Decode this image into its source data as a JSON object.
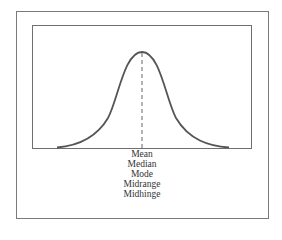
{
  "figure": {
    "type": "symmetric bell-shaped distribution",
    "curve_color": "#555555",
    "frame_color": "#7a7a7a",
    "center_line": "dashed",
    "labels": [
      "Mean",
      "Median",
      "Mode",
      "Midrange",
      "Midhinge"
    ]
  }
}
